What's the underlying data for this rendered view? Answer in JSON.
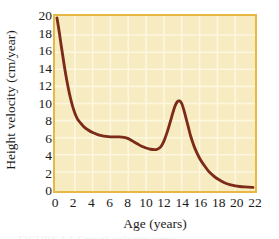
{
  "figure": {
    "name": "height-velocity-growth-curve",
    "background_color": "#ffffff",
    "plot_background_color": "#f7ebc2",
    "frame_color": "#e8b845",
    "curve_color": "#7b2b18",
    "grid_color": "#fdf7e0",
    "text_color": "#1b1b1b",
    "caption_sliver": "FIGURE 1.1 Growth velocity curve"
  },
  "chart_data": {
    "type": "line",
    "title": "",
    "subtitle": "",
    "xlabel": "Age (years)",
    "ylabel": "Height velocity (cm/year)",
    "xlim": [
      0,
      22
    ],
    "ylim": [
      0,
      20
    ],
    "xticks": [
      0,
      2,
      4,
      6,
      8,
      10,
      12,
      14,
      16,
      18,
      20,
      22
    ],
    "yticks": [
      0,
      2,
      4,
      6,
      8,
      10,
      12,
      14,
      16,
      18,
      20
    ],
    "grid": true,
    "legend": null,
    "legend_position": null,
    "annotations": [],
    "series": [
      {
        "name": "Height velocity",
        "color": "#7b2b18",
        "x": [
          0,
          0.25,
          0.5,
          0.75,
          1,
          1.25,
          1.5,
          1.75,
          2,
          2.25,
          2.5,
          2.75,
          3,
          3.5,
          4,
          4.5,
          5,
          5.5,
          6,
          6.5,
          7,
          7.5,
          8,
          8.5,
          9,
          9.5,
          10,
          10.5,
          11,
          11.25,
          11.5,
          11.75,
          12,
          12.25,
          12.5,
          12.75,
          13,
          13.25,
          13.5,
          13.75,
          14,
          14.25,
          14.5,
          14.75,
          15,
          15.25,
          15.5,
          16,
          16.5,
          17,
          17.5,
          18,
          18.5,
          19,
          19.5,
          20,
          20.5,
          21,
          21.5,
          22
        ],
        "y": [
          20.0,
          18.4,
          16.6,
          14.9,
          13.3,
          11.9,
          10.7,
          9.7,
          8.9,
          8.3,
          7.9,
          7.6,
          7.3,
          6.9,
          6.6,
          6.4,
          6.25,
          6.15,
          6.1,
          6.1,
          6.1,
          6.05,
          5.9,
          5.6,
          5.3,
          5.0,
          4.8,
          4.65,
          4.6,
          4.65,
          4.8,
          5.1,
          5.6,
          6.3,
          7.1,
          8.0,
          8.9,
          9.7,
          10.2,
          10.3,
          10.0,
          9.2,
          8.2,
          7.2,
          6.2,
          5.4,
          4.7,
          3.6,
          2.8,
          2.1,
          1.6,
          1.2,
          0.9,
          0.65,
          0.5,
          0.38,
          0.3,
          0.25,
          0.22,
          0.2
        ]
      }
    ],
    "key_points": {
      "birth_velocity": 20.0,
      "mid_childhood_plateau": 6.1,
      "prepubertal_minimum": {
        "age": 11,
        "velocity": 4.6
      },
      "peak_height_velocity": {
        "age": 13.75,
        "velocity": 10.3
      },
      "adult_velocity": 0.2
    }
  }
}
